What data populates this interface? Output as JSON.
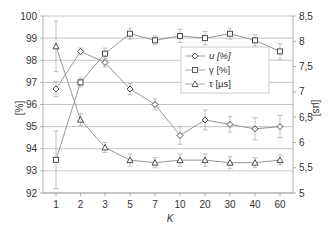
{
  "chart_data": {
    "type": "line",
    "title": "",
    "xlabel": "K",
    "ylabel": "[%]",
    "y2label": "[µs]",
    "categories": [
      "1",
      "2",
      "3",
      "5",
      "7",
      "10",
      "20",
      "30",
      "40",
      "60"
    ],
    "ylim": [
      92,
      100
    ],
    "y2lim": [
      5,
      8.5
    ],
    "yticks": [
      "92",
      "93",
      "94",
      "95",
      "96",
      "97",
      "98",
      "99",
      "100"
    ],
    "y2ticks": [
      "5",
      "5,5",
      "6",
      "6,5",
      "7",
      "7,5",
      "8",
      "8,5"
    ],
    "grid": true,
    "legend_position": "center-right",
    "series": [
      {
        "name": "u [%]",
        "axis": "left",
        "marker": "diamond",
        "values": [
          96.7,
          98.4,
          97.9,
          96.7,
          96.0,
          94.6,
          95.3,
          95.1,
          94.9,
          95.0
        ],
        "errors": [
          0.35,
          0.15,
          0.2,
          0.25,
          0.25,
          0.4,
          0.45,
          0.35,
          0.5,
          0.5
        ]
      },
      {
        "name": "γ [%]",
        "axis": "left",
        "marker": "square",
        "values": [
          93.5,
          97.0,
          98.3,
          99.2,
          98.9,
          99.1,
          99.0,
          99.2,
          98.9,
          98.4
        ],
        "errors": [
          1.3,
          0.2,
          0.25,
          0.25,
          0.2,
          0.3,
          0.3,
          0.25,
          0.25,
          0.35
        ]
      },
      {
        "name": "τ [µs]",
        "axis": "right",
        "marker": "triangle",
        "values": [
          7.9,
          6.45,
          5.9,
          5.65,
          5.6,
          5.65,
          5.65,
          5.6,
          5.6,
          5.65
        ],
        "errors": [
          0.5,
          0.12,
          0.1,
          0.12,
          0.1,
          0.12,
          0.12,
          0.12,
          0.1,
          0.1
        ]
      }
    ]
  },
  "legend": {
    "items": [
      "u [%]",
      "γ [%]",
      "τ [µs]"
    ]
  },
  "colors": {
    "line": "#8a8a8a",
    "marker": "#3a3a3a",
    "grid": "#b8b8b8",
    "axis": "#9a9a9a",
    "text": "#333333"
  }
}
